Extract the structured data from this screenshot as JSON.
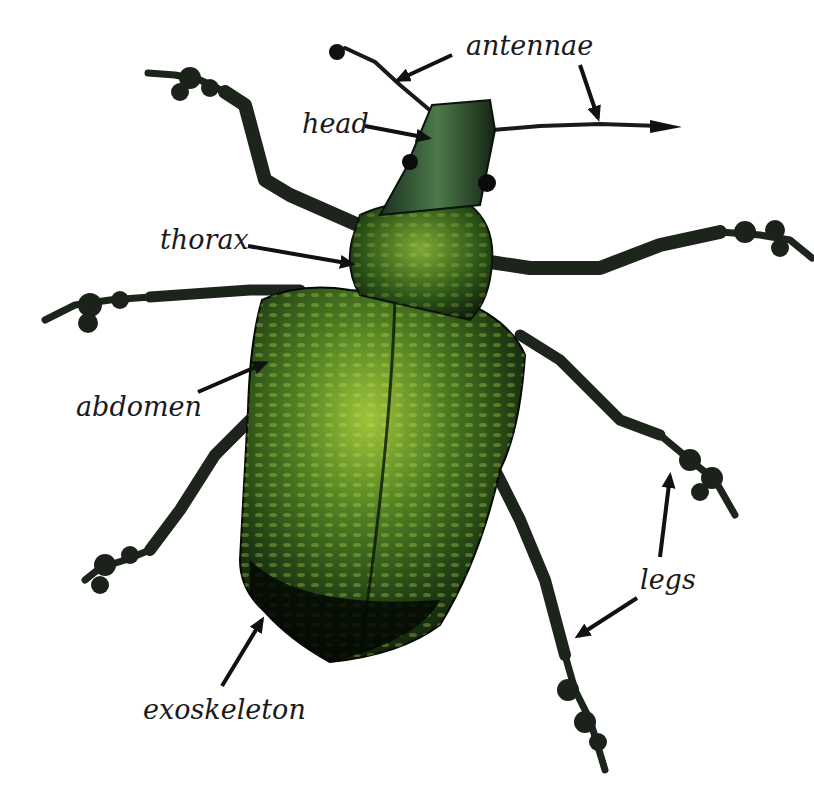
{
  "diagram": {
    "labels": [
      {
        "id": "antennae",
        "text": "antennae"
      },
      {
        "id": "head",
        "text": "head"
      },
      {
        "id": "thorax",
        "text": "thorax"
      },
      {
        "id": "abdomen",
        "text": "abdomen"
      },
      {
        "id": "legs",
        "text": "legs"
      },
      {
        "id": "exoskeleton",
        "text": "exoskeleton"
      }
    ],
    "colors": {
      "background": "#ffffff",
      "body_dark": "#0d1a0d",
      "body_green": "#2f5a1a",
      "highlight_green": "#b8d84a",
      "leg_dark": "#1c241c",
      "arrow": "#111111",
      "label_text": "#1a1a1a"
    }
  }
}
